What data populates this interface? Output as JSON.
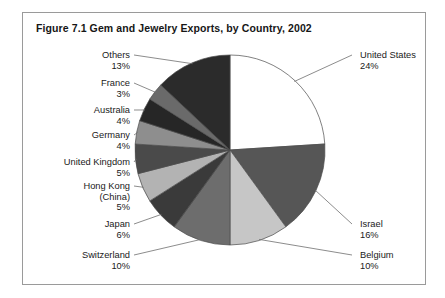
{
  "figure": {
    "title": "Figure 7.1  Gem and Jewelry Exports, by Country, 2002",
    "border_color": "#9a9a9a",
    "background": "#ffffff"
  },
  "chart_data": {
    "type": "pie",
    "title": "Figure 7.1  Gem and Jewelry Exports, by Country, 2002",
    "xlabel": "",
    "ylabel": "",
    "unit": "percent",
    "legend_position": "labels-with-leader-lines",
    "grid": false,
    "start_angle_deg": 0,
    "direction": "clockwise",
    "categories": [
      "United States",
      "Israel",
      "Belgium",
      "Switzerland",
      "Japan",
      "Hong Kong (China)",
      "United Kingdom",
      "Germany",
      "Australia",
      "France",
      "Others"
    ],
    "values": [
      24,
      16,
      10,
      10,
      6,
      5,
      5,
      4,
      4,
      3,
      13
    ],
    "value_labels": [
      "24%",
      "16%",
      "10%",
      "10%",
      "6%",
      "5%",
      "5%",
      "4%",
      "4%",
      "3%",
      "13%"
    ],
    "colors": [
      "#ffffff",
      "#565656",
      "#c6c6c6",
      "#6d6d6d",
      "#3a3a3a",
      "#b3b3b3",
      "#4a4a4a",
      "#8e8e8e",
      "#262626",
      "#6a6a6a",
      "#2b2b2b"
    ],
    "slice_border_color": "#4a4a4a"
  },
  "labels": {
    "right": [
      {
        "name": "United States",
        "pct": "24%"
      },
      {
        "name": "Israel",
        "pct": "16%"
      },
      {
        "name": "Belgium",
        "pct": "10%"
      }
    ],
    "left": [
      {
        "name": "Others",
        "pct": "13%"
      },
      {
        "name": "France",
        "pct": "3%"
      },
      {
        "name": "Australia",
        "pct": "4%"
      },
      {
        "name": "Germany",
        "pct": "4%"
      },
      {
        "name": "United Kingdom",
        "pct": "5%"
      },
      {
        "name": "Hong Kong",
        "name2": "(China)",
        "pct": "5%"
      },
      {
        "name": "Japan",
        "pct": "6%"
      },
      {
        "name": "Switzerland",
        "pct": "10%"
      }
    ]
  }
}
